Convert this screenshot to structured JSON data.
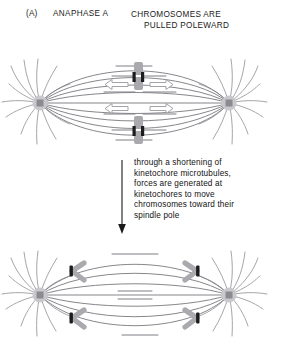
{
  "figure": {
    "panel_label": "(A)",
    "phase_label": "ANAPHASE A",
    "caption_line1": "CHROMOSOMES ARE",
    "caption_line2": "PULLED POLEWARD"
  },
  "annotation": {
    "arrow_icon": "down-arrow-icon",
    "line1": "through a shortening of",
    "line2": "kinetochore microtubules,",
    "line3": "forces are generated at",
    "line4": "kinetochores to move",
    "line5": "chromosomes toward their",
    "line6": "spindle pole"
  },
  "diagrams": {
    "top": {
      "name": "metaphase-plate-spindle",
      "description": "Bipolar spindle with two paired sister chromatids aligned at the metaphase plate, hollow arrows pointing outward toward each pole",
      "centrosome_left_x": 40,
      "centrosome_right_x": 229,
      "centrosome_y": 55,
      "chromosome_count": 2,
      "arrow_count": 4
    },
    "bottom": {
      "name": "anaphase-a-spindle",
      "description": "Bipolar spindle after chromatid separation; four V-shaped chromatids moved close to the two spindle poles",
      "centrosome_left_x": 40,
      "centrosome_right_x": 229,
      "centrosome_y": 55,
      "chromatid_count": 4
    }
  },
  "colors": {
    "microtubule": "#8a8a8e",
    "astral_microtubule": "#9b9ba0",
    "centrosome_halo": "#c9c9cd",
    "centrosome_core": "#8b8b90",
    "chromosome_body": "#a9a9ae",
    "kinetochore": "#1c1c1c",
    "arrow_outline": "#9a9a9f",
    "text": "#1a1a1a",
    "background": "#ffffff"
  }
}
